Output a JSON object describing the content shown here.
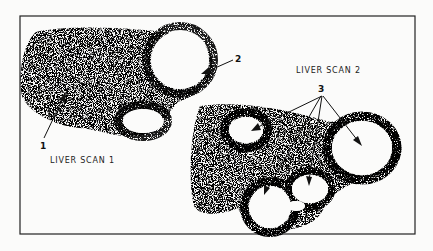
{
  "figure": {
    "scan1_label": "LIVER SCAN 1",
    "scan2_label": "LIVER SCAN 2",
    "callouts": {
      "one": "1",
      "two": "2",
      "three": "3"
    },
    "colors": {
      "ink": "#1a1a1a",
      "paper": "#fbfbfa"
    }
  }
}
